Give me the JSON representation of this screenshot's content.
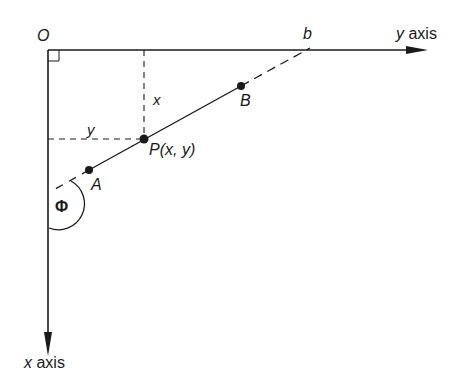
{
  "diagram": {
    "origin_label": "O",
    "intercept_label": "b",
    "y_axis_var": "y",
    "y_axis_word": "axis",
    "x_axis_var": "x",
    "x_axis_word": "axis",
    "point_a_label": "A",
    "point_b_label": "B",
    "point_p_label": "P(x, y)",
    "x_distance_label": "x",
    "y_distance_label": "y",
    "angle_label": "Φ",
    "colors": {
      "ink": "#1a1a1a",
      "background": "#ffffff"
    }
  }
}
